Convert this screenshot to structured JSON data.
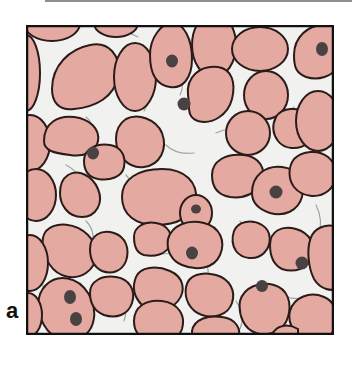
{
  "figure": {
    "panel_label": "a",
    "colors": {
      "cell_fill": "#E4AAA1",
      "cell_outline": "#2B1B19",
      "nucleus": "#4A4242",
      "matrix": "#F1F1EF",
      "fiber": "#9FA3A3",
      "frame": "#111111",
      "top_rule": "#8E8E8E"
    }
  }
}
